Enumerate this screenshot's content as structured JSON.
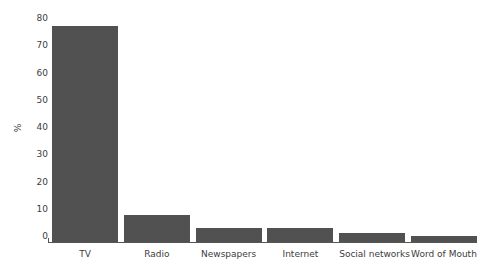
{
  "chart_data": {
    "type": "bar",
    "title": "",
    "subtitle": "",
    "xlabel": "",
    "ylabel": "%",
    "categories": [
      "TV",
      "Radio",
      "Newspapers",
      "Internet",
      "Social networks",
      "Word of Mouth"
    ],
    "values": [
      77,
      9.5,
      5,
      5,
      3.3,
      2.2
    ],
    "ylim": [
      0,
      80
    ],
    "ytick_labels": [
      "80",
      "70",
      "60",
      "50",
      "40",
      "30",
      "20",
      "10",
      "0"
    ],
    "ytick_values": [
      80,
      70,
      60,
      50,
      40,
      30,
      20,
      10,
      0
    ],
    "grid": false,
    "legend": "none",
    "bar_color": "#515151",
    "axis_color": "#555555",
    "text_color": "#3d3d3d",
    "background_color": "#ffffff"
  }
}
